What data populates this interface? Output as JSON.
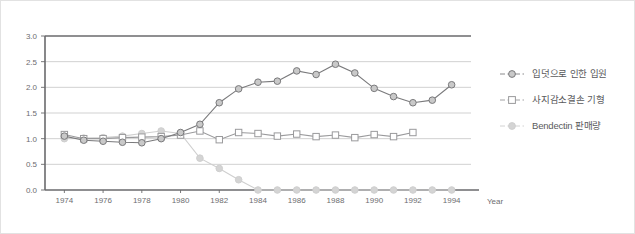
{
  "chart_data": {
    "type": "line",
    "title": "",
    "subtitle": "",
    "xlabel": "Year",
    "ylabel": "",
    "xlim": [
      1973,
      1995
    ],
    "ylim": [
      0.0,
      3.0
    ],
    "ytick_step": 0.5,
    "grid": true,
    "grid_axis": "y",
    "legend_position": "right",
    "x": [
      1974,
      1975,
      1976,
      1977,
      1978,
      1979,
      1980,
      1981,
      1982,
      1983,
      1984,
      1985,
      1986,
      1987,
      1988,
      1989,
      1990,
      1991,
      1992,
      1993,
      1994
    ],
    "xticks": [
      "1974",
      "1976",
      "1978",
      "1980",
      "1982",
      "1984",
      "1986",
      "1988",
      "1990",
      "1992",
      "1994"
    ],
    "yticks": [
      "0.0",
      "0.5",
      "1.0",
      "1.5",
      "2.0",
      "2.5",
      "3.0"
    ],
    "series": [
      {
        "name": "입덧으로 인한 입원",
        "marker": "circle-open",
        "color": "#7a7a7c",
        "marker_fill": "#c9c9c9",
        "values": [
          1.05,
          0.97,
          0.95,
          0.93,
          0.92,
          1.0,
          1.12,
          1.28,
          1.7,
          1.97,
          2.1,
          2.12,
          2.32,
          2.25,
          2.45,
          2.28,
          1.98,
          1.82,
          1.7,
          1.75,
          2.05
        ]
      },
      {
        "name": "사지감소결손 기형",
        "marker": "square-open",
        "color": "#9a9a9c",
        "marker_fill": "#ffffff",
        "values": [
          1.08,
          1.0,
          1.0,
          1.02,
          1.03,
          1.04,
          1.07,
          1.15,
          0.98,
          1.12,
          1.1,
          1.05,
          1.09,
          1.04,
          1.07,
          1.02,
          1.08,
          1.04,
          1.12,
          null,
          null
        ]
      },
      {
        "name": "Bendectin 판매량",
        "marker": "circle-filled",
        "color": "#cfcfcf",
        "marker_fill": "#d4d4d4",
        "values": [
          1.0,
          1.01,
          1.02,
          1.05,
          1.1,
          1.15,
          1.1,
          0.62,
          0.42,
          0.2,
          0.0,
          0.0,
          0.0,
          0.0,
          0.0,
          0.0,
          0.0,
          0.0,
          0.0,
          0.0,
          0.0
        ]
      }
    ]
  },
  "legend": {
    "items": [
      {
        "label": "입덧으로 인한 입원",
        "marker": "circle-open-marker"
      },
      {
        "label": "사지감소결손 기형",
        "marker": "square-open-marker"
      },
      {
        "label": "Bendectin 판매량",
        "marker": "circle-filled-marker"
      }
    ]
  },
  "axes": {
    "x_title": "Year"
  },
  "colors": {
    "series_1": "#7a7a7c",
    "series_2": "#9a9a9c",
    "series_3": "#cfcfcf",
    "axis": "#6a6a6c",
    "grid": "#c5c5c5",
    "frame_border": "#e2e2e2"
  }
}
